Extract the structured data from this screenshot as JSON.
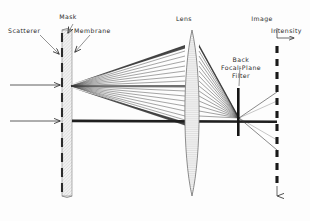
{
  "figure": {
    "kind": "optical-ray-diagram",
    "title_visible": false,
    "background_color": "#fdfdfd",
    "ink_color": "#222222"
  },
  "labels": {
    "scatterer": "Scatterer",
    "mask": "Mask",
    "membrane": "Membrane",
    "lens": "Lens",
    "image": "Image",
    "intensity": "Intensity",
    "filter_line1": "Back",
    "filter_line2": "Focal-Plane",
    "filter_line3": "Filter"
  },
  "components": {
    "mask": {
      "name": "mask-plate",
      "x": 62,
      "y_top": 30,
      "y_bottom": 196,
      "width": 10,
      "fill": "#ededed",
      "stroke": "#8a8a8a"
    },
    "scatterers": {
      "name": "scatterer-dashes",
      "x": 62,
      "count": 11,
      "dash_length": 9,
      "gap": 6,
      "color": "#2b2b2b"
    },
    "lens": {
      "name": "biconvex-lens",
      "center_x": 192,
      "y_top": 30,
      "y_bottom": 196,
      "half_width": 9,
      "fill": "#efefef",
      "stroke": "#6e6e6e"
    },
    "filter": {
      "name": "back-focal-plane-filter",
      "x": 238,
      "y_top": 88,
      "y_bottom": 136,
      "thickness": 2.4,
      "color": "#151515"
    },
    "image_plane": {
      "name": "image-plane-dashed-axis",
      "x": 277,
      "y_top": 45,
      "y_bottom": 196,
      "dash_length": 7,
      "gap": 6,
      "color": "#1a1a1a"
    },
    "intensity_axis": {
      "name": "intensity-axis",
      "origin_x": 277,
      "origin_y": 38,
      "vertical_top_y": 28,
      "arrow_x": 296,
      "arrow_y": 38
    }
  },
  "rays": {
    "input_beams": [
      {
        "name": "input-beam-upper",
        "y": 85,
        "x_start": 10,
        "x_end": 62
      },
      {
        "name": "input-beam-lower",
        "y": 121,
        "x_start": 10,
        "x_end": 62
      }
    ],
    "scattered_fan": {
      "name": "scattered-ray-fan",
      "source_x": 71,
      "source_y": 86,
      "ray_count": 17,
      "lens_span_top": 46,
      "lens_span_bottom": 124
    },
    "direct_beam": {
      "name": "direct-transmitted-beam",
      "y": 121,
      "x_start": 72,
      "x_end": 277
    },
    "converged_focus": {
      "x": 239,
      "y": 119
    },
    "output_rays": [
      {
        "name": "output-ray-upper",
        "to_x": 277,
        "to_y": 92
      },
      {
        "name": "output-ray-lower",
        "to_x": 277,
        "to_y": 150
      }
    ]
  },
  "label_positions": {
    "scatterer": {
      "x": 30,
      "y": 31
    },
    "mask": {
      "x": 68,
      "y": 19
    },
    "membrane": {
      "x": 89,
      "y": 31
    },
    "lens": {
      "x": 184,
      "y": 20
    },
    "image": {
      "x": 260,
      "y": 20
    },
    "intensity": {
      "x": 273,
      "y": 32
    },
    "filter": {
      "x": 242,
      "y": 60
    }
  }
}
